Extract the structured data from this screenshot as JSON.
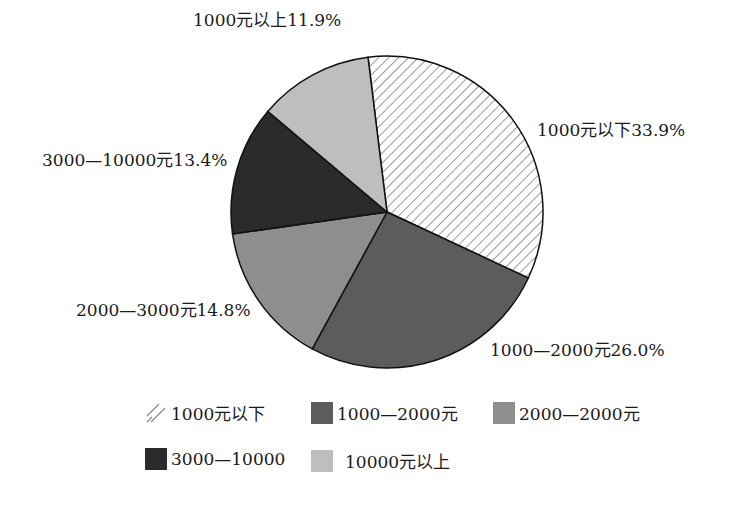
{
  "chart_data": {
    "type": "pie",
    "title": "",
    "start_angle_deg": -7,
    "direction": "clockwise",
    "slices": [
      {
        "label": "1000元以下",
        "value": 33.9,
        "display": "1000元以下33.9%",
        "fill": "hatch",
        "color": "#ffffff"
      },
      {
        "label": "1000—2000元",
        "value": 26.0,
        "display": "1000—2000元26.0%",
        "fill": "solid",
        "color": "#5c5c5c"
      },
      {
        "label": "2000—3000元",
        "value": 14.8,
        "display": "2000—3000元14.8%",
        "fill": "solid",
        "color": "#8e8e8e"
      },
      {
        "label": "3000—10000元",
        "value": 13.4,
        "display": "3000—10000元13.4%",
        "fill": "solid",
        "color": "#2b2b2b"
      },
      {
        "label": "1000元以上",
        "value": 11.9,
        "display": "1000元以上11.9%",
        "fill": "solid",
        "color": "#bebebe"
      }
    ],
    "legend": {
      "position": "bottom",
      "entries": [
        {
          "label": "1000元以下",
          "fill": "hatch",
          "color": "#ffffff"
        },
        {
          "label": "1000—2000元",
          "fill": "solid",
          "color": "#5c5c5c"
        },
        {
          "label": "2000—2000元",
          "fill": "solid",
          "color": "#8e8e8e"
        },
        {
          "label": "3000—10000",
          "fill": "solid",
          "color": "#2b2b2b"
        },
        {
          "label": "10000元以上",
          "fill": "solid",
          "color": "#bebebe"
        }
      ]
    }
  }
}
